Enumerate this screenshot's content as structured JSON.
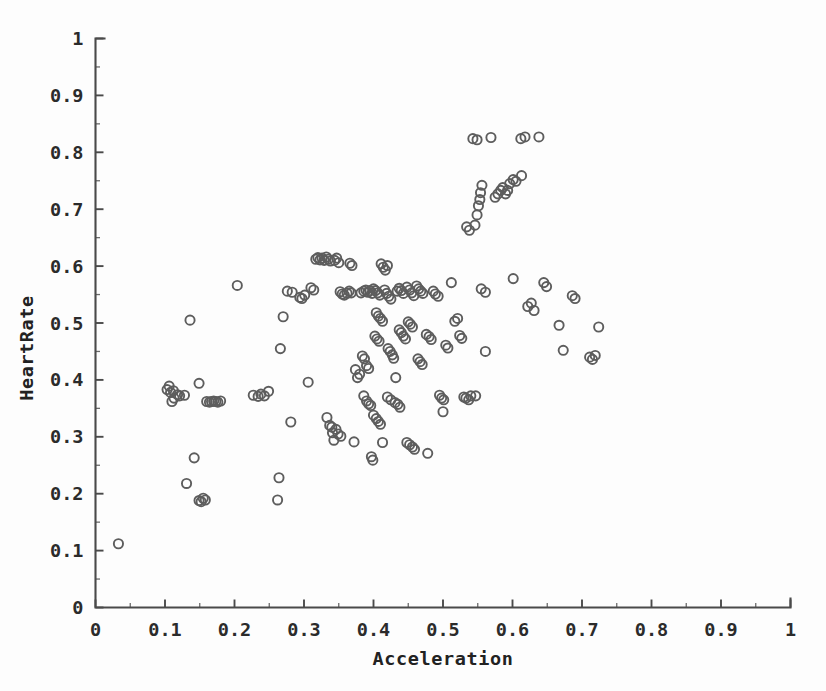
{
  "chart_data": {
    "type": "scatter",
    "title": "",
    "xlabel": "Acceleration",
    "ylabel": "HeartRate",
    "xlim": [
      0,
      1
    ],
    "ylim": [
      0,
      1
    ],
    "grid": false,
    "legend": null,
    "marker": {
      "shape": "circle-open",
      "radius_px": 4.6,
      "stroke_color": "#5d5d5d",
      "fill": "none",
      "stroke_width": 1.9
    },
    "axis_color": "#4a4a4a",
    "background_color": "#fdfdfd",
    "xticks": [
      0,
      0.1,
      0.2,
      0.3,
      0.4,
      0.5,
      0.6,
      0.7,
      0.8,
      0.9,
      1
    ],
    "yticks": [
      0,
      0.1,
      0.2,
      0.3,
      0.4,
      0.5,
      0.6,
      0.7,
      0.8,
      0.9,
      1
    ],
    "xticklabels": [
      "0",
      "0.1",
      "0.2",
      "0.3",
      "0.4",
      "0.5",
      "0.6",
      "0.7",
      "0.8",
      "0.9",
      "1"
    ],
    "yticklabels": [
      "0",
      "0.1",
      "0.2",
      "0.3",
      "0.4",
      "0.5",
      "0.6",
      "0.7",
      "0.8",
      "0.9",
      "1"
    ],
    "minor_ticks_per_interval": 1,
    "n_points": 186,
    "points": [
      [
        0.033,
        0.112
      ],
      [
        0.103,
        0.383
      ],
      [
        0.106,
        0.389
      ],
      [
        0.108,
        0.378
      ],
      [
        0.112,
        0.381
      ],
      [
        0.113,
        0.368
      ],
      [
        0.118,
        0.374
      ],
      [
        0.121,
        0.372
      ],
      [
        0.11,
        0.362
      ],
      [
        0.128,
        0.373
      ],
      [
        0.131,
        0.218
      ],
      [
        0.136,
        0.505
      ],
      [
        0.142,
        0.263
      ],
      [
        0.149,
        0.188
      ],
      [
        0.152,
        0.186
      ],
      [
        0.155,
        0.192
      ],
      [
        0.158,
        0.189
      ],
      [
        0.149,
        0.394
      ],
      [
        0.16,
        0.362
      ],
      [
        0.164,
        0.361
      ],
      [
        0.167,
        0.362
      ],
      [
        0.17,
        0.363
      ],
      [
        0.173,
        0.362
      ],
      [
        0.176,
        0.361
      ],
      [
        0.18,
        0.363
      ],
      [
        0.204,
        0.566
      ],
      [
        0.227,
        0.373
      ],
      [
        0.234,
        0.371
      ],
      [
        0.238,
        0.375
      ],
      [
        0.243,
        0.372
      ],
      [
        0.249,
        0.38
      ],
      [
        0.262,
        0.189
      ],
      [
        0.264,
        0.228
      ],
      [
        0.266,
        0.455
      ],
      [
        0.27,
        0.511
      ],
      [
        0.276,
        0.556
      ],
      [
        0.281,
        0.326
      ],
      [
        0.283,
        0.554
      ],
      [
        0.294,
        0.545
      ],
      [
        0.297,
        0.543
      ],
      [
        0.301,
        0.549
      ],
      [
        0.306,
        0.396
      ],
      [
        0.31,
        0.562
      ],
      [
        0.314,
        0.558
      ],
      [
        0.317,
        0.612
      ],
      [
        0.32,
        0.615
      ],
      [
        0.323,
        0.611
      ],
      [
        0.326,
        0.614
      ],
      [
        0.329,
        0.61
      ],
      [
        0.332,
        0.616
      ],
      [
        0.335,
        0.612
      ],
      [
        0.338,
        0.609
      ],
      [
        0.333,
        0.334
      ],
      [
        0.337,
        0.32
      ],
      [
        0.34,
        0.317
      ],
      [
        0.341,
        0.307
      ],
      [
        0.343,
        0.294
      ],
      [
        0.344,
        0.61
      ],
      [
        0.347,
        0.614
      ],
      [
        0.35,
        0.606
      ],
      [
        0.352,
        0.555
      ],
      [
        0.355,
        0.551
      ],
      [
        0.358,
        0.549
      ],
      [
        0.346,
        0.313
      ],
      [
        0.349,
        0.305
      ],
      [
        0.353,
        0.301
      ],
      [
        0.362,
        0.552
      ],
      [
        0.365,
        0.556
      ],
      [
        0.368,
        0.553
      ],
      [
        0.366,
        0.605
      ],
      [
        0.369,
        0.601
      ],
      [
        0.372,
        0.291
      ],
      [
        0.374,
        0.418
      ],
      [
        0.377,
        0.404
      ],
      [
        0.38,
        0.41
      ],
      [
        0.382,
        0.553
      ],
      [
        0.386,
        0.556
      ],
      [
        0.389,
        0.558
      ],
      [
        0.392,
        0.554
      ],
      [
        0.395,
        0.557
      ],
      [
        0.398,
        0.552
      ],
      [
        0.384,
        0.442
      ],
      [
        0.387,
        0.437
      ],
      [
        0.39,
        0.425
      ],
      [
        0.393,
        0.42
      ],
      [
        0.386,
        0.372
      ],
      [
        0.39,
        0.363
      ],
      [
        0.393,
        0.358
      ],
      [
        0.396,
        0.355
      ],
      [
        0.4,
        0.56
      ],
      [
        0.403,
        0.557
      ],
      [
        0.406,
        0.553
      ],
      [
        0.409,
        0.549
      ],
      [
        0.404,
        0.518
      ],
      [
        0.407,
        0.512
      ],
      [
        0.41,
        0.508
      ],
      [
        0.413,
        0.503
      ],
      [
        0.402,
        0.477
      ],
      [
        0.405,
        0.472
      ],
      [
        0.408,
        0.468
      ],
      [
        0.4,
        0.338
      ],
      [
        0.404,
        0.332
      ],
      [
        0.407,
        0.327
      ],
      [
        0.41,
        0.322
      ],
      [
        0.413,
        0.29
      ],
      [
        0.397,
        0.265
      ],
      [
        0.399,
        0.259
      ],
      [
        0.411,
        0.604
      ],
      [
        0.414,
        0.598
      ],
      [
        0.417,
        0.593
      ],
      [
        0.42,
        0.601
      ],
      [
        0.416,
        0.558
      ],
      [
        0.419,
        0.552
      ],
      [
        0.422,
        0.547
      ],
      [
        0.425,
        0.542
      ],
      [
        0.421,
        0.455
      ],
      [
        0.424,
        0.45
      ],
      [
        0.427,
        0.444
      ],
      [
        0.429,
        0.438
      ],
      [
        0.432,
        0.404
      ],
      [
        0.42,
        0.37
      ],
      [
        0.425,
        0.365
      ],
      [
        0.431,
        0.36
      ],
      [
        0.435,
        0.357
      ],
      [
        0.438,
        0.352
      ],
      [
        0.434,
        0.556
      ],
      [
        0.437,
        0.561
      ],
      [
        0.44,
        0.557
      ],
      [
        0.443,
        0.552
      ],
      [
        0.437,
        0.488
      ],
      [
        0.44,
        0.483
      ],
      [
        0.443,
        0.477
      ],
      [
        0.446,
        0.472
      ],
      [
        0.448,
        0.563
      ],
      [
        0.452,
        0.558
      ],
      [
        0.455,
        0.553
      ],
      [
        0.458,
        0.548
      ],
      [
        0.45,
        0.502
      ],
      [
        0.453,
        0.498
      ],
      [
        0.456,
        0.493
      ],
      [
        0.448,
        0.29
      ],
      [
        0.452,
        0.286
      ],
      [
        0.456,
        0.282
      ],
      [
        0.459,
        0.278
      ],
      [
        0.462,
        0.565
      ],
      [
        0.465,
        0.56
      ],
      [
        0.468,
        0.556
      ],
      [
        0.471,
        0.552
      ],
      [
        0.464,
        0.437
      ],
      [
        0.467,
        0.432
      ],
      [
        0.47,
        0.427
      ],
      [
        0.476,
        0.48
      ],
      [
        0.48,
        0.476
      ],
      [
        0.483,
        0.471
      ],
      [
        0.478,
        0.271
      ],
      [
        0.486,
        0.556
      ],
      [
        0.489,
        0.551
      ],
      [
        0.493,
        0.547
      ],
      [
        0.495,
        0.373
      ],
      [
        0.498,
        0.368
      ],
      [
        0.501,
        0.365
      ],
      [
        0.504,
        0.461
      ],
      [
        0.507,
        0.456
      ],
      [
        0.5,
        0.344
      ],
      [
        0.512,
        0.571
      ],
      [
        0.517,
        0.503
      ],
      [
        0.521,
        0.508
      ],
      [
        0.524,
        0.478
      ],
      [
        0.527,
        0.473
      ],
      [
        0.53,
        0.37
      ],
      [
        0.533,
        0.368
      ],
      [
        0.537,
        0.365
      ],
      [
        0.54,
        0.372
      ],
      [
        0.534,
        0.669
      ],
      [
        0.538,
        0.663
      ],
      [
        0.543,
        0.824
      ],
      [
        0.549,
        0.822
      ],
      [
        0.546,
        0.672
      ],
      [
        0.549,
        0.69
      ],
      [
        0.551,
        0.706
      ],
      [
        0.553,
        0.717
      ],
      [
        0.554,
        0.729
      ],
      [
        0.556,
        0.742
      ],
      [
        0.555,
        0.56
      ],
      [
        0.561,
        0.554
      ],
      [
        0.547,
        0.372
      ],
      [
        0.569,
        0.826
      ],
      [
        0.575,
        0.721
      ],
      [
        0.579,
        0.727
      ],
      [
        0.583,
        0.733
      ],
      [
        0.586,
        0.738
      ],
      [
        0.59,
        0.727
      ],
      [
        0.593,
        0.733
      ],
      [
        0.561,
        0.45
      ],
      [
        0.596,
        0.745
      ],
      [
        0.601,
        0.752
      ],
      [
        0.605,
        0.749
      ],
      [
        0.601,
        0.578
      ],
      [
        0.612,
        0.824
      ],
      [
        0.618,
        0.827
      ],
      [
        0.613,
        0.759
      ],
      [
        0.622,
        0.529
      ],
      [
        0.627,
        0.535
      ],
      [
        0.631,
        0.522
      ],
      [
        0.638,
        0.827
      ],
      [
        0.645,
        0.571
      ],
      [
        0.649,
        0.564
      ],
      [
        0.667,
        0.496
      ],
      [
        0.673,
        0.452
      ],
      [
        0.686,
        0.548
      ],
      [
        0.69,
        0.543
      ],
      [
        0.711,
        0.44
      ],
      [
        0.715,
        0.436
      ],
      [
        0.719,
        0.443
      ],
      [
        0.724,
        0.493
      ]
    ]
  },
  "axes": {
    "x_axis_name": "x-axis",
    "y_axis_name": "y-axis"
  }
}
